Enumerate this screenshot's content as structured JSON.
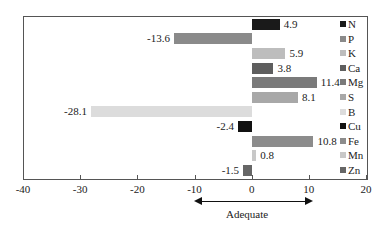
{
  "chart_data": {
    "type": "bar",
    "orientation": "horizontal",
    "title": "",
    "xlabel": "",
    "ylabel": "",
    "xlim": [
      -40,
      20
    ],
    "x_ticks": [
      -40,
      -30,
      -20,
      -10,
      0,
      10,
      20
    ],
    "grid": false,
    "legend_position": "right-inside",
    "categories": [
      "N",
      "P",
      "K",
      "Ca",
      "Mg",
      "S",
      "B",
      "Cu",
      "Fe",
      "Mn",
      "Zn"
    ],
    "values": [
      4.9,
      -13.6,
      5.9,
      3.8,
      11.4,
      8.1,
      -28.1,
      -2.4,
      10.8,
      0.8,
      -1.5
    ],
    "value_labels": [
      "4.9",
      "-13.6",
      "5.9",
      "3.8",
      "11.4",
      "8.1",
      "-28.1",
      "-2.4",
      "10.8",
      "0.8",
      "-1.5"
    ],
    "colors": [
      "#1a1a1a",
      "#8a8a8a",
      "#bdbdbd",
      "#5e5e5e",
      "#7a7a7a",
      "#a8a8a8",
      "#dcdcdc",
      "#111111",
      "#8c8c8c",
      "#c8c8c8",
      "#666666"
    ],
    "annotation": {
      "label": "Adequate",
      "range": [
        -10,
        10
      ],
      "style": "double-headed arrow below x-axis"
    }
  },
  "ticks": [
    "-40",
    "-30",
    "-20",
    "-10",
    "0",
    "10",
    "20"
  ],
  "annotation_label": "Adequate"
}
